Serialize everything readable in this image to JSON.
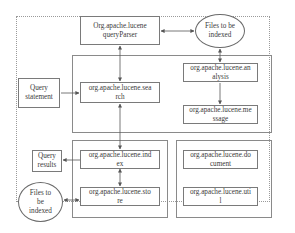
{
  "diagram": {
    "nodes": {
      "query_parser": {
        "label": "Org.apache.lucene queryParser"
      },
      "files_top": {
        "label": "Files to be indexed"
      },
      "query_statement": {
        "label": "Query statement"
      },
      "search": {
        "label": "org.apache.lucene.search"
      },
      "analysis": {
        "label": "org.apache.lucene.analysis"
      },
      "message": {
        "label": "org.apache.lucene.message"
      },
      "query_results": {
        "label": "Query results"
      },
      "index": {
        "label": "org.apache.lucene.index"
      },
      "store": {
        "label": "org.apache.lucene.store"
      },
      "files_bottom": {
        "label": "Files to be indexed"
      },
      "document": {
        "label": "org.apache.lucene.document"
      },
      "util": {
        "label": "org.apache.lucene.util"
      }
    },
    "display": {
      "query_parser": "Org.apache.lucene\nqueryParser",
      "files_top": "Files to be\nindexed",
      "query_statement": "Query\nstatement",
      "search": "org.apache.lucene.sea\nrch",
      "analysis": "org.apache.lucene.an\nalysis",
      "message": "org.apache.lucene.me\nssage",
      "query_results": "Query\nresults",
      "index": "org.apache.lucene.ind\nex",
      "store": "org.apache.lucene.sto\nre",
      "files_bottom": "Files to\nbe\nindexed",
      "document": "org.apache.lucene.do\ncument",
      "util": "org.apache.lucene.uti\nl"
    },
    "edges": [
      {
        "from": "query_parser",
        "to": "files_top",
        "type": "bidirectional"
      },
      {
        "from": "query_parser",
        "to": "search",
        "type": "bidirectional"
      },
      {
        "from": "files_top",
        "to": "analysis",
        "type": "bidirectional"
      },
      {
        "from": "analysis",
        "to": "message",
        "type": "directed"
      },
      {
        "from": "query_statement",
        "to": "search",
        "type": "directed"
      },
      {
        "from": "search",
        "to": "index",
        "type": "bidirectional"
      },
      {
        "from": "index",
        "to": "query_results",
        "type": "directed"
      },
      {
        "from": "index",
        "to": "store",
        "type": "bidirectional"
      },
      {
        "from": "files_bottom",
        "to": "store",
        "type": "bidirectional"
      }
    ],
    "colors": {
      "line": "#555555",
      "border": "#7a7a7a",
      "text": "#3a3a3a"
    }
  }
}
